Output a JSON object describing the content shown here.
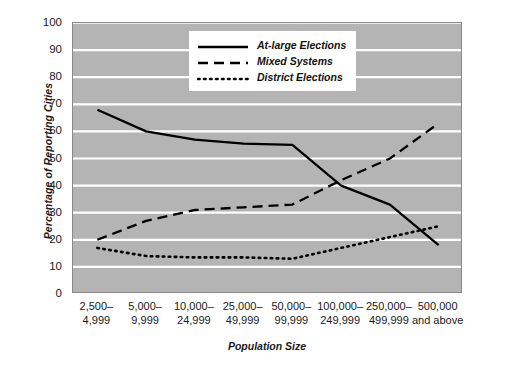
{
  "chart_data": {
    "type": "line",
    "title": "",
    "xlabel": "Population Size",
    "ylabel": "Percentage of Reporting Cities",
    "categories": [
      "2,500–\n4,999",
      "5,000–\n9,999",
      "10,000–\n24,999",
      "25,000–\n49,999",
      "50,000–\n99,999",
      "100,000–\n249,999",
      "250,000–\n499,999",
      "500,000\nand above"
    ],
    "category_lines": [
      [
        "2,500–",
        "4,999"
      ],
      [
        "5,000–",
        "9,999"
      ],
      [
        "10,000–",
        "24,999"
      ],
      [
        "25,000–",
        "49,999"
      ],
      [
        "50,000–",
        "99,999"
      ],
      [
        "100,000–",
        "249,999"
      ],
      [
        "250,000–",
        "499,999"
      ],
      [
        "500,000",
        "and above"
      ]
    ],
    "series": [
      {
        "name": "At-large Elections",
        "style": "solid",
        "color": "#000000",
        "values": [
          68,
          60,
          57,
          55.5,
          55,
          40,
          33,
          18
        ]
      },
      {
        "name": "Mixed Systems",
        "style": "dashed",
        "color": "#000000",
        "values": [
          20,
          27,
          31,
          32,
          33,
          42,
          50,
          63
        ]
      },
      {
        "name": "District Elections",
        "style": "dotted",
        "color": "#000000",
        "values": [
          17,
          14,
          13.5,
          13.5,
          13,
          17,
          21,
          25
        ]
      }
    ],
    "ylim": [
      0,
      100
    ],
    "ytick_values": [
      0,
      10,
      20,
      30,
      40,
      50,
      60,
      70,
      80,
      90,
      100
    ],
    "ytick_labels": [
      "0",
      "10",
      "20",
      "30",
      "40",
      "50",
      "60",
      "70",
      "80",
      "90",
      "100"
    ],
    "grid": "horizontal",
    "grid_color": "#ffffff",
    "plot_background": "#b4b4b4",
    "legend_position": "upper-center",
    "legend_entries": [
      "At-large Elections",
      "Mixed Systems",
      "District Elections"
    ]
  }
}
